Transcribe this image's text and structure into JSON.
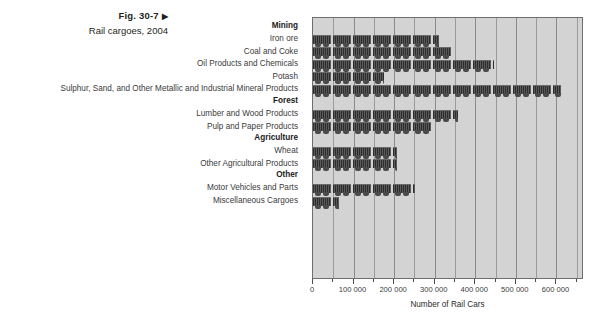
{
  "caption": {
    "figure_number": "Fig. 30-7",
    "arrow_glyph": "▶",
    "subtitle": "Rail cargoes, 2004"
  },
  "axis": {
    "x_title": "Number of Rail Cars",
    "tick_labels": [
      "0",
      "100 000",
      "200 000",
      "300 000",
      "400 000",
      "500 000",
      "600 000"
    ]
  },
  "colors": {
    "plot_background": "#d3d3d3",
    "plot_border": "#6e6e6e",
    "gridline": "#9a9a9a",
    "bar_fill": "#3a3a3a",
    "text": "#3b3b3b",
    "heading_text": "#1a1a1a"
  },
  "chart_data": {
    "type": "bar",
    "orientation": "horizontal",
    "title": "Rail cargoes, 2004",
    "xlabel": "Number of Rail Cars",
    "ylabel": "",
    "xlim": [
      0,
      668000
    ],
    "xticks": [
      0,
      100000,
      200000,
      300000,
      400000,
      500000,
      600000
    ],
    "minor_tick_step": 50000,
    "grid": true,
    "legend": false,
    "pictograph": "rail-car",
    "groups": [
      {
        "name": "Mining",
        "categories": [
          "Iron ore",
          "Coal and Coke",
          "Oil Products and Chemicals",
          "Potash",
          "Sulphur, Sand, and Other Metallic and Industrial Mineral Products"
        ],
        "values": [
          310000,
          340000,
          446000,
          175000,
          611000
        ]
      },
      {
        "name": "Forest",
        "categories": [
          "Lumber and Wood Products",
          "Pulp and Paper Products"
        ],
        "values": [
          357000,
          293000
        ]
      },
      {
        "name": "Agriculture",
        "categories": [
          "Wheat",
          "Other Agricultural Products"
        ],
        "values": [
          207000,
          207000
        ]
      },
      {
        "name": "Other",
        "categories": [
          "Motor Vehicles and Parts",
          "Miscellaneous Cargoes"
        ],
        "values": [
          251000,
          64000
        ]
      }
    ],
    "categories": [
      "Iron ore",
      "Coal and Coke",
      "Oil Products and Chemicals",
      "Potash",
      "Sulphur, Sand, and Other Metallic and Industrial Mineral Products",
      "Lumber and Wood Products",
      "Pulp and Paper Products",
      "Wheat",
      "Other Agricultural Products",
      "Motor Vehicles and Parts",
      "Miscellaneous Cargoes"
    ],
    "values": [
      310000,
      340000,
      446000,
      175000,
      611000,
      357000,
      293000,
      207000,
      207000,
      251000,
      64000
    ]
  }
}
